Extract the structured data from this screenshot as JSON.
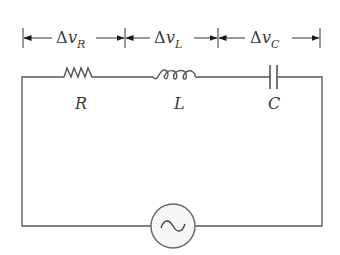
{
  "diagram": {
    "type": "series RLC circuit with AC source",
    "voltage_labels": [
      {
        "delta": "Δ",
        "var": "v",
        "sub": "R"
      },
      {
        "delta": "Δ",
        "var": "v",
        "sub": "L"
      },
      {
        "delta": "Δ",
        "var": "v",
        "sub": "C"
      }
    ],
    "components": [
      {
        "symbol": "resistor",
        "label": "R"
      },
      {
        "symbol": "inductor",
        "label": "L"
      },
      {
        "symbol": "capacitor",
        "label": "C"
      }
    ],
    "source": {
      "symbol": "ac-source",
      "glyph": "~"
    },
    "colors": {
      "wire": "#555555",
      "text": "#3a3a3a",
      "arrow": "#1a1a1a"
    }
  }
}
